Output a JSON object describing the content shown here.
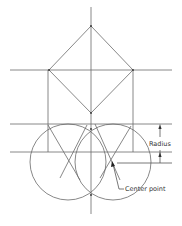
{
  "diagram": {
    "labels": {
      "radius": "Radius",
      "center_point": "Center point"
    },
    "colors": {
      "line": "#6a6a6a",
      "text": "#333333",
      "background": "#ffffff"
    }
  }
}
